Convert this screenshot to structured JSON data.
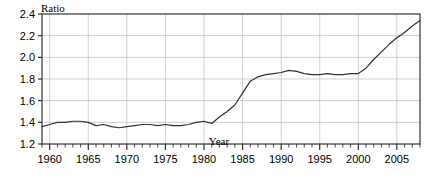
{
  "chart_data": {
    "type": "line",
    "title": "",
    "xlabel": "Year",
    "ylabel": "Ratio",
    "xlim": [
      1959,
      2008
    ],
    "ylim": [
      1.2,
      2.4
    ],
    "grid": true,
    "legend": false,
    "y_ticks": [
      "1.2",
      "1.4",
      "1.6",
      "1.8",
      "2.0",
      "2.2",
      "2.4"
    ],
    "y_tick_values": [
      1.2,
      1.4,
      1.6,
      1.8,
      2.0,
      2.2,
      2.4
    ],
    "x_ticks": [
      "1960",
      "1965",
      "1970",
      "1975",
      "1980",
      "1985",
      "1990",
      "1995",
      "2000",
      "2005"
    ],
    "x_tick_values": [
      1960,
      1965,
      1970,
      1975,
      1980,
      1985,
      1990,
      1995,
      2000,
      2005
    ],
    "x_minor_tick_step": 1,
    "line_color": "#333333",
    "x": [
      1959,
      1960,
      1961,
      1962,
      1963,
      1964,
      1965,
      1966,
      1967,
      1968,
      1969,
      1970,
      1971,
      1972,
      1973,
      1974,
      1975,
      1976,
      1977,
      1978,
      1979,
      1980,
      1981,
      1982,
      1983,
      1984,
      1985,
      1986,
      1987,
      1988,
      1989,
      1990,
      1991,
      1992,
      1993,
      1994,
      1995,
      1996,
      1997,
      1998,
      1999,
      2000,
      2001,
      2002,
      2003,
      2004,
      2005,
      2006,
      2007,
      2008
    ],
    "values": [
      1.36,
      1.38,
      1.4,
      1.4,
      1.41,
      1.41,
      1.4,
      1.37,
      1.38,
      1.36,
      1.35,
      1.36,
      1.37,
      1.38,
      1.38,
      1.37,
      1.38,
      1.37,
      1.37,
      1.38,
      1.4,
      1.41,
      1.39,
      1.45,
      1.5,
      1.56,
      1.67,
      1.78,
      1.82,
      1.84,
      1.85,
      1.86,
      1.88,
      1.87,
      1.85,
      1.84,
      1.84,
      1.85,
      1.84,
      1.84,
      1.85,
      1.85,
      1.9,
      1.98,
      2.05,
      2.12,
      2.18,
      2.23,
      2.29,
      2.34
    ],
    "series": [
      {
        "name": "Ratio",
        "values": [
          1.36,
          1.38,
          1.4,
          1.4,
          1.41,
          1.41,
          1.4,
          1.37,
          1.38,
          1.36,
          1.35,
          1.36,
          1.37,
          1.38,
          1.38,
          1.37,
          1.38,
          1.37,
          1.37,
          1.38,
          1.4,
          1.41,
          1.39,
          1.45,
          1.5,
          1.56,
          1.67,
          1.78,
          1.82,
          1.84,
          1.85,
          1.86,
          1.88,
          1.87,
          1.85,
          1.84,
          1.84,
          1.85,
          1.84,
          1.84,
          1.85,
          1.85,
          1.9,
          1.98,
          2.05,
          2.12,
          2.18,
          2.23,
          2.29,
          2.34
        ]
      }
    ]
  }
}
